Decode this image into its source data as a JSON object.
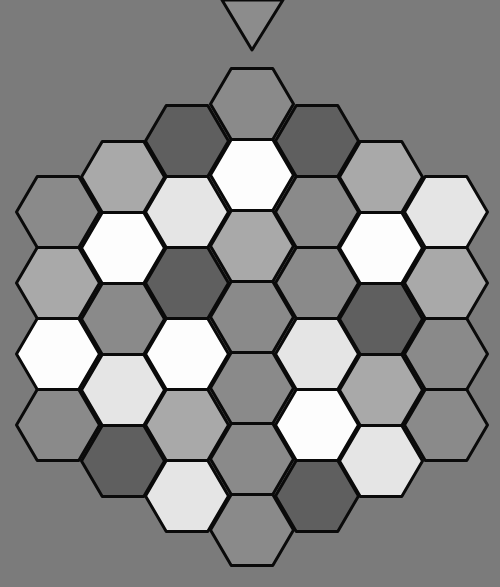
{
  "game": {
    "board_type": "hex-grid",
    "orientation": "flat-top",
    "columns": 7,
    "background_color": "#7b7b7b",
    "outline_color": "#0a0a0a"
  },
  "marker": {
    "icon": "down-triangle-icon",
    "fill": "#8c8c8c",
    "points": [
      [
        222,
        0
      ],
      [
        283,
        0
      ],
      [
        252,
        50
      ]
    ]
  },
  "palette": {
    "W": "#fdfdfd",
    "L": "#e5e5e5",
    "ML": "#a9a9a9",
    "M": "#8a8a8a",
    "D": "#5f5f5f"
  },
  "hex_geometry": {
    "half_width": 41.5,
    "half_height": 35.5,
    "col_spacing": 64.7
  },
  "board": {
    "columns": [
      {
        "x": 58,
        "cells": [
          {
            "y": 212,
            "shade": "M"
          },
          {
            "y": 283,
            "shade": "ML"
          },
          {
            "y": 354,
            "shade": "W"
          },
          {
            "y": 425,
            "shade": "M"
          }
        ]
      },
      {
        "x": 123,
        "cells": [
          {
            "y": 177,
            "shade": "ML"
          },
          {
            "y": 248,
            "shade": "W"
          },
          {
            "y": 319,
            "shade": "M"
          },
          {
            "y": 390,
            "shade": "L"
          },
          {
            "y": 461,
            "shade": "D"
          }
        ]
      },
      {
        "x": 187,
        "cells": [
          {
            "y": 141,
            "shade": "D"
          },
          {
            "y": 212,
            "shade": "L"
          },
          {
            "y": 283,
            "shade": "D"
          },
          {
            "y": 354,
            "shade": "W"
          },
          {
            "y": 425,
            "shade": "ML"
          },
          {
            "y": 496,
            "shade": "L"
          }
        ]
      },
      {
        "x": 252,
        "cells": [
          {
            "y": 104,
            "shade": "M"
          },
          {
            "y": 175,
            "shade": "W"
          },
          {
            "y": 246,
            "shade": "ML"
          },
          {
            "y": 317,
            "shade": "M"
          },
          {
            "y": 388,
            "shade": "M"
          },
          {
            "y": 459,
            "shade": "M"
          },
          {
            "y": 530,
            "shade": "M"
          }
        ]
      },
      {
        "x": 317,
        "cells": [
          {
            "y": 141,
            "shade": "D"
          },
          {
            "y": 212,
            "shade": "M"
          },
          {
            "y": 283,
            "shade": "M"
          },
          {
            "y": 354,
            "shade": "L"
          },
          {
            "y": 425,
            "shade": "W"
          },
          {
            "y": 496,
            "shade": "D"
          }
        ]
      },
      {
        "x": 381,
        "cells": [
          {
            "y": 177,
            "shade": "ML"
          },
          {
            "y": 248,
            "shade": "W"
          },
          {
            "y": 319,
            "shade": "D"
          },
          {
            "y": 390,
            "shade": "ML"
          },
          {
            "y": 461,
            "shade": "L"
          }
        ]
      },
      {
        "x": 446,
        "cells": [
          {
            "y": 212,
            "shade": "L"
          },
          {
            "y": 283,
            "shade": "ML"
          },
          {
            "y": 354,
            "shade": "M"
          },
          {
            "y": 425,
            "shade": "M"
          }
        ]
      }
    ]
  }
}
